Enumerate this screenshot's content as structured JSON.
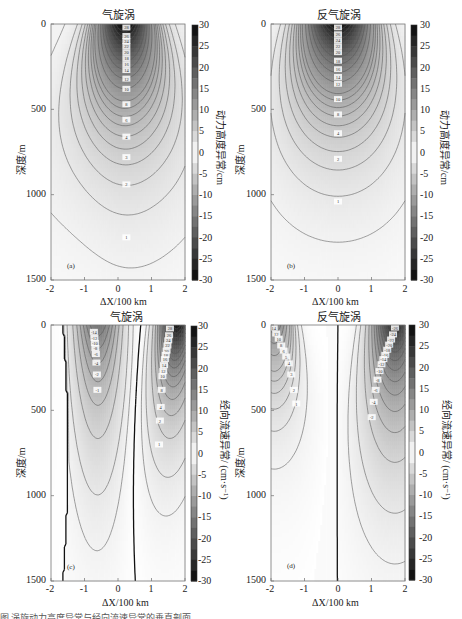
{
  "chart_data": [
    {
      "type": "heatmap",
      "panel": "a",
      "title": "气旋涡",
      "xlabel": "ΔX/100 km",
      "ylabel": "深度/m",
      "colorbar_label": "动力高度异常/cm",
      "xlim": [
        -2,
        2
      ],
      "ylim": [
        1500,
        0
      ],
      "xticks": [
        "-2",
        "-1",
        "0",
        "1",
        "2"
      ],
      "yticks": [
        "0",
        "500",
        "1000",
        "1500"
      ],
      "colorbar_ticks": [
        "30",
        "25",
        "20",
        "15",
        "10",
        "5",
        "0",
        "-5",
        "-10",
        "-15",
        "-20",
        "-25",
        "-30"
      ],
      "clim": [
        -30,
        30
      ],
      "center_x": 0.2,
      "max_value_at_surface": 30,
      "contour_labels": [
        "28",
        "26",
        "24",
        "22",
        "20",
        "18",
        "16",
        "14",
        "12",
        "10",
        "8",
        "6",
        "4",
        "2",
        "1"
      ],
      "letter": "(a)"
    },
    {
      "type": "heatmap",
      "panel": "b",
      "title": "反气旋涡",
      "xlabel": "ΔX/100 km",
      "ylabel": "深度/m",
      "colorbar_label": "动力高度异常/cm",
      "xlim": [
        -2,
        2
      ],
      "ylim": [
        1500,
        0
      ],
      "xticks": [
        "-2",
        "-1",
        "0",
        "1",
        "2"
      ],
      "yticks": [
        "0",
        "500",
        "1000",
        "1500"
      ],
      "colorbar_ticks": [
        "30",
        "25",
        "20",
        "15",
        "10",
        "5",
        "0",
        "-5",
        "-10",
        "-15",
        "-20",
        "-25",
        "-30"
      ],
      "clim": [
        -30,
        30
      ],
      "center_x": 0.0,
      "max_value_at_surface": 30,
      "contour_labels": [
        "28",
        "26",
        "24",
        "22",
        "20",
        "18",
        "16",
        "14",
        "12",
        "10",
        "8",
        "6",
        "4",
        "3",
        "2",
        "1"
      ],
      "letter": "(b)"
    },
    {
      "type": "heatmap",
      "panel": "c",
      "title": "气旋涡",
      "xlabel": "ΔX/100 km",
      "ylabel": "深度/m",
      "colorbar_label": "经向流速异常/(cm·s⁻¹)",
      "xlim": [
        -2,
        2
      ],
      "ylim": [
        1500,
        0
      ],
      "xticks": [
        "-2",
        "-1",
        "0",
        "1",
        "2"
      ],
      "yticks": [
        "0",
        "500",
        "1000",
        "1500"
      ],
      "colorbar_ticks": [
        "30",
        "25",
        "20",
        "15",
        "10",
        "5",
        "0",
        "-5",
        "-10",
        "-15",
        "-20",
        "-25",
        "-30"
      ],
      "clim": [
        -30,
        30
      ],
      "zero_line_x": [
        -1.6,
        0.2
      ],
      "negative_lobe_center_x": -0.6,
      "positive_lobe_center_x": 1.3,
      "positive_max": 30,
      "negative_min": -16,
      "contour_labels_positive": [
        "28",
        "26",
        "24",
        "22",
        "20",
        "18",
        "16",
        "14",
        "12",
        "10",
        "8",
        "6",
        "4",
        "2",
        "1"
      ],
      "contour_labels_negative": [
        "-16",
        "-14",
        "-12",
        "-10",
        "-8",
        "-6",
        "-4",
        "-2",
        "-1"
      ],
      "letter": "(c)"
    },
    {
      "type": "heatmap",
      "panel": "d",
      "title": "反气旋涡",
      "xlabel": "ΔX/100 km",
      "ylabel": "深度/m",
      "colorbar_label": "经向流速异常/(cm·s⁻¹)",
      "xlim": [
        -2,
        2
      ],
      "ylim": [
        1500,
        0
      ],
      "xticks": [
        "-2",
        "-1",
        "0",
        "1",
        "2"
      ],
      "yticks": [
        "0",
        "500",
        "1000",
        "1500"
      ],
      "colorbar_ticks": [
        "30",
        "25",
        "20",
        "15",
        "10",
        "5",
        "0",
        "-5",
        "-10",
        "-15",
        "-20",
        "-25",
        "-30"
      ],
      "clim": [
        -30,
        30
      ],
      "zero_line_x": [
        0.0
      ],
      "positive_lobe_center_x": -1.9,
      "negative_lobe_center_x": 1.7,
      "positive_max": 14,
      "negative_min": -26,
      "contour_labels_positive": [
        "14",
        "12",
        "10",
        "8",
        "6",
        "5",
        "4",
        "3",
        "2",
        "1"
      ],
      "contour_labels_negative": [
        "-26",
        "-24",
        "-22",
        "-20",
        "-18",
        "-16",
        "-14",
        "-12",
        "-10",
        "-8",
        "-6",
        "-4",
        "-2",
        "-1"
      ],
      "letter": "(d)"
    }
  ],
  "panels": {
    "a": {
      "title": "气旋涡",
      "letter": "(a)",
      "ylabel": "深度/m",
      "xlabel": "ΔX/100 km",
      "cblabel": "动力高度异常/cm"
    },
    "b": {
      "title": "反气旋涡",
      "letter": "(b)",
      "ylabel": "深度/m",
      "xlabel": "ΔX/100 km",
      "cblabel": "动力高度异常/cm"
    },
    "c": {
      "title": "气旋涡",
      "letter": "(c)",
      "ylabel": "深度/m",
      "xlabel": "ΔX/100 km",
      "cblabel": "经向流速异常/ (cm·s⁻¹)"
    },
    "d": {
      "title": "反气旋涡",
      "letter": "(d)",
      "ylabel": "深度/m",
      "xlabel": "ΔX/100 km",
      "cblabel": "经向流速异常/ (cm·s⁻¹)"
    }
  },
  "ticks": {
    "x": [
      "-2",
      "-1",
      "0",
      "1",
      "2"
    ],
    "y": [
      "0",
      "500",
      "1000",
      "1500"
    ],
    "cb": [
      "30",
      "25",
      "20",
      "15",
      "10",
      "5",
      "0",
      "-5",
      "-10",
      "-15",
      "-20",
      "-25",
      "-30"
    ]
  },
  "caption": "图 涡旋动力高度异常与经向流速异常的垂直剖面"
}
